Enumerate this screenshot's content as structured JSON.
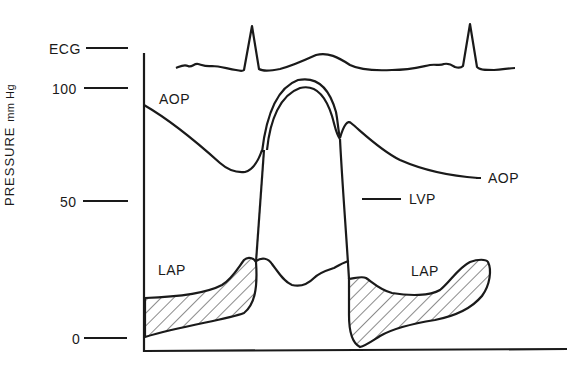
{
  "figure": {
    "y_axis_label": "PRESSURE",
    "y_axis_unit": "mm Hg",
    "tick_labels": {
      "ecg": "ECG",
      "y100": "100",
      "y50": "50",
      "y0": "0"
    },
    "curve_labels": {
      "aop_left": "AOP",
      "aop_right": "AOP",
      "lvp": "LVP",
      "lap_left": "LAP",
      "lap_right": "LAP"
    },
    "colors": {
      "ink": "#1a1a1a",
      "background": "#ffffff"
    },
    "traces": [
      "ECG",
      "AOP (aortic pressure)",
      "LVP (left ventricular pressure)",
      "LAP (left atrial pressure)"
    ],
    "y_ticks": [
      0,
      50,
      100
    ]
  }
}
